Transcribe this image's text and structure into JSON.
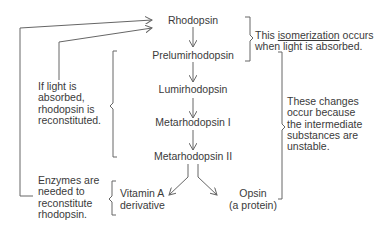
{
  "pathway": {
    "steps": [
      {
        "label": "Rhodopsin"
      },
      {
        "label": "Prelumirhodopsin"
      },
      {
        "label": "Lumirhodopsin"
      },
      {
        "label": "Metarhodopsin I"
      },
      {
        "label": "Metarhodopsin II"
      }
    ],
    "products": [
      {
        "line1": "Vitamin A",
        "line2": "derivative"
      },
      {
        "line1": "Opsin",
        "line2": "(a protein)"
      }
    ]
  },
  "notes": {
    "isomerization": {
      "pre": "This ",
      "term": "isomerization",
      "post": " occurs",
      "line2": "when light is absorbed."
    },
    "changes": {
      "lines": [
        "These changes",
        "occur because",
        "the intermediate",
        "substances are",
        "unstable."
      ]
    },
    "light_absorbed": {
      "lines": [
        "If light is",
        "absorbed,",
        "rhodopsin is",
        "reconstituted."
      ]
    },
    "enzymes": {
      "lines": [
        "Enzymes are",
        "needed to",
        "reconstitute",
        "rhodopsin."
      ]
    }
  },
  "colors": {
    "line": "#666666",
    "text": "#3a3a3a",
    "background": "#ffffff"
  }
}
